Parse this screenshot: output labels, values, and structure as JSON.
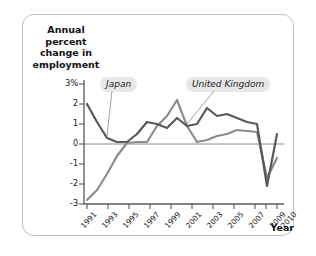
{
  "figure": {
    "y_axis_title": "Annual percent change in employment",
    "x_axis_title": "Year"
  },
  "labels": {
    "japan": "Japan",
    "united_kingdom": "United Kingdom"
  },
  "colors": {
    "japan_line": "#595959",
    "uk_line": "#8c8c8c",
    "zero_line": "#8c8c8c",
    "axis": "#595959",
    "frame": "#bdbdbd",
    "callout_bg": "#e8e8e8",
    "text": "#111111"
  },
  "chart_data": {
    "type": "line",
    "title": "",
    "subtitle": "",
    "xlabel": "Year",
    "ylabel": "Annual percent change in employment",
    "xlim": [
      1991,
      2010
    ],
    "ylim": [
      -3,
      3
    ],
    "grid": false,
    "legend_position": "inline-callouts",
    "y_ticks": [
      "3%",
      "2",
      "1",
      "0",
      "-1",
      "-2",
      "-3"
    ],
    "y_tick_values": [
      3,
      2,
      1,
      0,
      -1,
      -2,
      -3
    ],
    "x_ticks": [
      "1991",
      "1993",
      "1995",
      "1997",
      "1999",
      "2001",
      "2003",
      "2005",
      "2007",
      "2009",
      "2010"
    ],
    "x_tick_values": [
      1991,
      1993,
      1995,
      1997,
      1999,
      2001,
      2003,
      2005,
      2007,
      2009,
      2010
    ],
    "x": [
      1991,
      1992,
      1993,
      1994,
      1995,
      1996,
      1997,
      1998,
      1999,
      2000,
      2001,
      2002,
      2003,
      2004,
      2005,
      2006,
      2007,
      2008,
      2009,
      2010
    ],
    "series": [
      {
        "name": "Japan",
        "color": "#595959",
        "values": [
          2.0,
          1.1,
          0.3,
          0.1,
          0.1,
          0.5,
          1.1,
          1.0,
          0.8,
          1.3,
          0.9,
          1.0,
          1.8,
          1.4,
          1.5,
          1.3,
          1.1,
          1.0,
          -2.1,
          0.5
        ]
      },
      {
        "name": "United Kingdom",
        "color": "#8c8c8c",
        "values": [
          -2.8,
          -2.3,
          -1.5,
          -0.6,
          0.05,
          0.1,
          0.1,
          0.9,
          1.4,
          2.2,
          0.9,
          0.1,
          0.2,
          0.4,
          0.5,
          0.7,
          0.65,
          0.6,
          -1.7,
          -0.7
        ]
      }
    ],
    "annotations": [
      {
        "text": "Japan",
        "points_to_year": 1993,
        "points_to_value": 0.4
      },
      {
        "text": "United Kingdom",
        "points_to_year": 2001,
        "points_to_value": 1.0
      }
    ]
  }
}
